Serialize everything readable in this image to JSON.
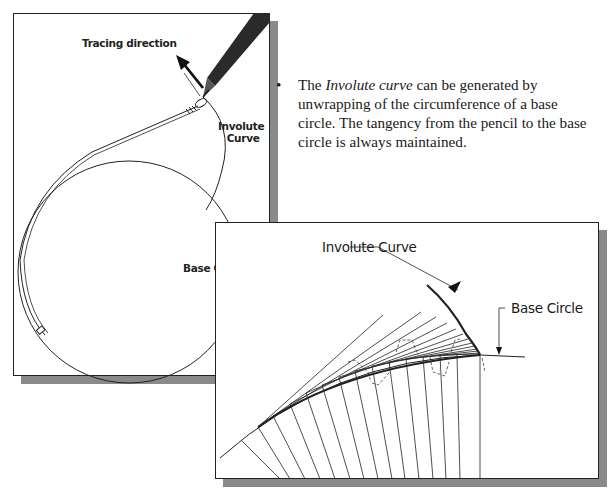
{
  "figure_left": {
    "labels": {
      "tracing_direction": "Tracing direction",
      "involute_curve_line1": "Involute",
      "involute_curve_line2": "Curve",
      "base_circle": "Base Circle"
    },
    "icons": [
      "pencil-icon",
      "direction-arrow-icon",
      "string-loop-icon"
    ]
  },
  "bullet": {
    "marker": "•",
    "text_before": "The ",
    "text_italic": "Involute curve",
    "text_after": " can be generated by unwrapping of the circumference of a base circle. The tangency from the pencil to the base circle is always maintained."
  },
  "figure_right": {
    "labels": {
      "involute_curve": "Involute Curve",
      "base_circle": "Base Circle"
    }
  }
}
